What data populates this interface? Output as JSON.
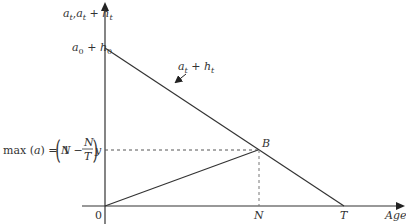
{
  "diagram": {
    "y_axis_label": {
      "a": "a",
      "sub1": "t",
      "sep": ",",
      "a2": "a",
      "sub2": "t",
      "plus": " + ",
      "h": "h",
      "sub3": "t"
    },
    "intercept_label": {
      "a": "a",
      "sub1": "0",
      "plus": " + ",
      "h": "h",
      "sub2": "0"
    },
    "line_label": {
      "a": "a",
      "sub1": "t",
      "plus": " + ",
      "h": "h",
      "sub2": "t"
    },
    "max_label": {
      "prefix": "max (",
      "a": "a",
      "suffix": ") = ",
      "N": "N",
      "one_minus": "1 −",
      "frac_num": "N",
      "frac_den": "T",
      "y": "y"
    },
    "point_B": "B",
    "origin": "0",
    "tick_N": "N",
    "tick_T": "T",
    "x_axis_label": "Age",
    "colors": {
      "line": "#333333",
      "dashed": "#555555"
    }
  }
}
